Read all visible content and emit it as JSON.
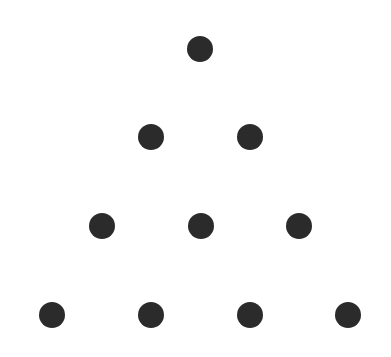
{
  "diagram": {
    "title": "",
    "dot_color": "#2b2b2b",
    "background": "#ffffff",
    "dot_radius": 13,
    "rows": [
      {
        "y": 49,
        "xs": [
          200
        ]
      },
      {
        "y": 137,
        "xs": [
          151,
          250
        ]
      },
      {
        "y": 226,
        "xs": [
          102,
          201,
          299
        ]
      },
      {
        "y": 315,
        "xs": [
          52,
          151,
          250,
          348
        ]
      }
    ]
  }
}
